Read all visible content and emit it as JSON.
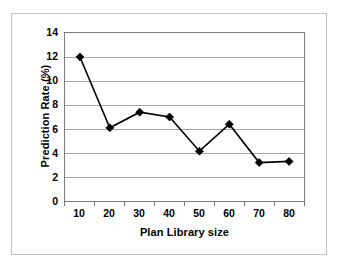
{
  "chart_data": {
    "type": "line",
    "title": "",
    "xlabel": "Plan Library size",
    "ylabel": "Prediction Rate (%)",
    "categories": [
      10,
      20,
      30,
      40,
      50,
      60,
      70,
      80
    ],
    "x_tick_labels": [
      "10",
      "20",
      "30",
      "40",
      "50",
      "60",
      "70",
      "80"
    ],
    "values": [
      12.0,
      6.1,
      7.4,
      7.0,
      4.15,
      6.4,
      3.2,
      3.3
    ],
    "series": [
      {
        "name": "Prediction Rate",
        "values": [
          12.0,
          6.1,
          7.4,
          7.0,
          4.15,
          6.4,
          3.2,
          3.3
        ],
        "marker": "diamond",
        "color": "#000000"
      }
    ],
    "ylim": [
      0,
      14
    ],
    "y_tick_step": 2,
    "y_tick_labels": [
      "0",
      "2",
      "4",
      "6",
      "8",
      "10",
      "12",
      "14"
    ],
    "grid": "horizontal",
    "legend": "none",
    "plot_background": "#ffffff",
    "gridline_color": "#a6a6a6",
    "axis_color": "#7a7a7a",
    "frame_color": "#bfbfbf"
  }
}
